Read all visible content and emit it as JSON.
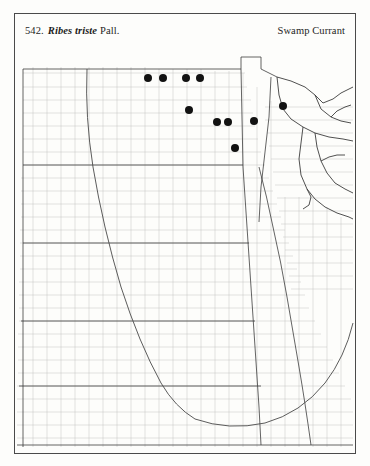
{
  "plate": {
    "entry_number": "542.",
    "scientific_name": "Ribes triste",
    "authority": "Pall.",
    "common_name": "Swamp Currant"
  },
  "map": {
    "type": "dot-distribution-map",
    "region": "Upper Midwest, United States",
    "frame_color": "#4a4a4a",
    "background_color": "#fdfdfb",
    "county_line_color": "#b9b9b9",
    "state_line_color": "#3c3c3c",
    "dot_color": "#121212",
    "dot_count": 10,
    "dot_diameter_px": 8
  },
  "chart_data": {
    "type": "scatter",
    "xlabel": "",
    "ylabel": "",
    "xlim": [
      0,
      340
    ],
    "ylim": [
      0,
      406
    ],
    "grid": false,
    "legend": "none",
    "series": [
      {
        "name": "Occurrence records",
        "marker": "filled-circle",
        "color": "#121212",
        "points": [
          {
            "x": 133,
            "y": 31,
            "label": "record-1"
          },
          {
            "x": 148,
            "y": 31,
            "label": "record-2"
          },
          {
            "x": 171,
            "y": 31,
            "label": "record-3"
          },
          {
            "x": 185,
            "y": 31,
            "label": "record-4"
          },
          {
            "x": 174,
            "y": 63,
            "label": "record-5"
          },
          {
            "x": 202,
            "y": 75,
            "label": "record-6"
          },
          {
            "x": 213,
            "y": 75,
            "label": "record-7"
          },
          {
            "x": 239,
            "y": 74,
            "label": "record-8"
          },
          {
            "x": 268,
            "y": 59,
            "label": "record-9"
          },
          {
            "x": 220,
            "y": 101,
            "label": "record-10"
          }
        ]
      }
    ]
  }
}
